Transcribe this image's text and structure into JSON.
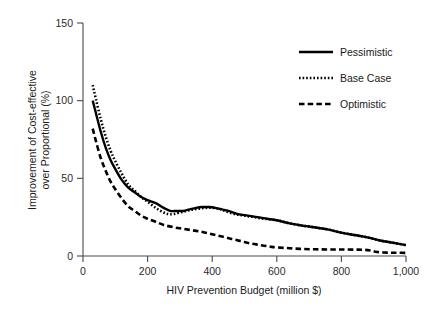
{
  "chart_data": {
    "type": "line",
    "title": "",
    "xlabel": "HIV Prevention Budget (million $)",
    "ylabel_line1": "Improvement of Cost-effective",
    "ylabel_line2": "over Proportional (%)",
    "xlim": [
      0,
      1000
    ],
    "ylim": [
      0,
      150
    ],
    "xticks": [
      0,
      200,
      400,
      600,
      800,
      1000
    ],
    "xtick_labels": [
      "0",
      "200",
      "400",
      "600",
      "800",
      "1,000"
    ],
    "yticks": [
      0,
      50,
      100,
      150
    ],
    "ytick_labels": [
      "0",
      "50",
      "100",
      "150"
    ],
    "grid": false,
    "legend_position": "top-right",
    "series": [
      {
        "name": "Pessimistic",
        "style": "solid",
        "color": "#000000",
        "x": [
          30,
          40,
          55,
          70,
          85,
          100,
          120,
          140,
          160,
          180,
          200,
          225,
          250,
          270,
          290,
          310,
          330,
          350,
          370,
          390,
          410,
          430,
          450,
          480,
          510,
          540,
          570,
          600,
          640,
          680,
          700,
          730,
          760,
          800,
          840,
          880,
          920,
          960,
          1000
        ],
        "y": [
          100,
          92,
          80,
          70,
          62,
          56,
          49,
          44,
          41,
          38,
          36,
          34,
          31,
          29,
          29,
          29,
          30,
          31,
          31.5,
          31.5,
          31,
          30,
          29,
          27,
          26,
          25,
          24,
          23,
          21,
          19.5,
          19,
          18,
          17,
          15,
          13.5,
          12,
          10,
          8.5,
          7
        ]
      },
      {
        "name": "Base Case",
        "style": "dotted",
        "color": "#000000",
        "x": [
          30,
          40,
          55,
          70,
          85,
          100,
          120,
          140,
          160,
          180,
          200,
          225,
          250,
          265,
          280,
          300,
          320,
          340,
          360,
          380,
          400,
          420,
          440,
          470,
          500,
          530,
          560,
          600,
          640,
          680,
          700,
          730,
          760,
          800,
          840,
          880,
          920,
          960,
          1000
        ],
        "y": [
          110,
          101,
          88,
          77,
          68,
          61,
          53,
          46,
          42,
          38,
          35,
          31,
          28,
          27,
          27,
          28,
          29,
          30,
          30.5,
          31,
          31,
          30.5,
          29,
          27,
          26,
          25,
          24,
          23,
          21,
          19.5,
          19,
          18,
          17,
          15,
          13.5,
          12,
          10,
          8.5,
          7
        ]
      },
      {
        "name": "Optimistic",
        "style": "dashed",
        "color": "#000000",
        "x": [
          30,
          40,
          55,
          70,
          85,
          100,
          120,
          140,
          160,
          180,
          200,
          225,
          250,
          280,
          310,
          340,
          370,
          400,
          430,
          460,
          490,
          520,
          550,
          580,
          600,
          640,
          680,
          720,
          760,
          800,
          840,
          870,
          890,
          910,
          940,
          970,
          1000
        ],
        "y": [
          82,
          74,
          63,
          55,
          48,
          43,
          37,
          32,
          29,
          26,
          24,
          22,
          20,
          18.5,
          17.5,
          16.5,
          15.5,
          14,
          12.5,
          11,
          9.5,
          8,
          7,
          6,
          5.5,
          5,
          4.5,
          4.3,
          4.2,
          4.2,
          4.1,
          4,
          3.5,
          2.6,
          2.2,
          2.1,
          2
        ]
      }
    ]
  },
  "legend": {
    "items": [
      {
        "label": "Pessimistic",
        "style": "solid"
      },
      {
        "label": "Base Case",
        "style": "dotted"
      },
      {
        "label": "Optimistic",
        "style": "dashed"
      }
    ]
  }
}
